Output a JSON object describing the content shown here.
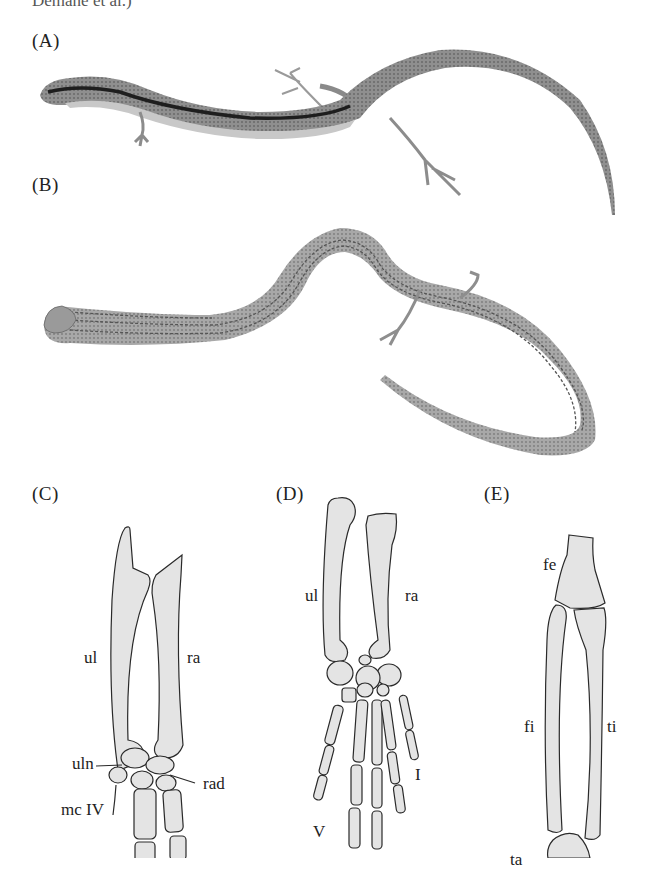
{
  "header": {
    "cutoff_caption": "Demane et al.)"
  },
  "panels": {
    "A": {
      "label": "(A)",
      "description": "Lateral view of striped skink with well-developed limbs"
    },
    "B": {
      "label": "(B)",
      "description": "Dorsal view of elongate skink with reduced limbs and striped pattern"
    },
    "C": {
      "label": "(C)",
      "bones": {
        "ulna": "ul",
        "radius": "ra",
        "ulnare": "uln",
        "radiale": "rad",
        "metacarpal": "mc IV"
      }
    },
    "D": {
      "label": "(D)",
      "bones": {
        "ulna": "ul",
        "radius": "ra",
        "digit_1": "I",
        "digit_5": "V"
      }
    },
    "E": {
      "label": "(E)",
      "bones": {
        "femur": "fe",
        "fibula": "fi",
        "tibia": "ti",
        "tarsal": "ta"
      }
    }
  },
  "colors": {
    "bone_fill": "#e4e4e4",
    "bone_outline": "#2a2a2a",
    "lizard_body": "#8a8a8a",
    "lizard_stripe": "#1e1e1e"
  }
}
